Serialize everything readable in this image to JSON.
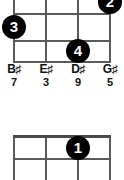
{
  "diagrams": [
    {
      "name": "upper-chord-diagram",
      "strings": 4,
      "string_x": [
        14,
        46,
        78,
        110
      ],
      "grid": {
        "top": -8,
        "bottom": 62,
        "left": 14,
        "right": 110
      },
      "frets_y": [
        13,
        40,
        62
      ],
      "dots": [
        {
          "label": "2",
          "string": 4,
          "fret_slot": 0,
          "x": 110,
          "y": 2
        },
        {
          "label": "3",
          "string": 1,
          "fret_slot": 1,
          "x": 14,
          "y": 27
        },
        {
          "label": "4",
          "string": 3,
          "fret_slot": 2,
          "x": 78,
          "y": 51
        }
      ],
      "labels": [
        {
          "note": "B",
          "accidental": "♯",
          "degree": "7",
          "x": 14
        },
        {
          "note": "E",
          "accidental": "♯",
          "degree": "3",
          "x": 46
        },
        {
          "note": "D",
          "accidental": "♯",
          "degree": "9",
          "x": 78
        },
        {
          "note": "G",
          "accidental": "♯",
          "degree": "5",
          "x": 110
        }
      ]
    },
    {
      "name": "lower-chord-diagram",
      "strings": 4,
      "string_x": [
        14,
        46,
        78,
        110
      ],
      "grid": {
        "top": 45,
        "bottom": 90,
        "left": 14,
        "right": 110
      },
      "frets_y": [
        45,
        68,
        90
      ],
      "dots": [
        {
          "label": "1",
          "string": 3,
          "fret_slot": 0,
          "x": 78,
          "y": 58
        }
      ],
      "labels": []
    }
  ],
  "colors": {
    "background": "#ffffff",
    "grid_line": "#5a5a5a",
    "dot_fill": "#000000",
    "dot_text": "#ffffff",
    "label_text": "#111111"
  }
}
